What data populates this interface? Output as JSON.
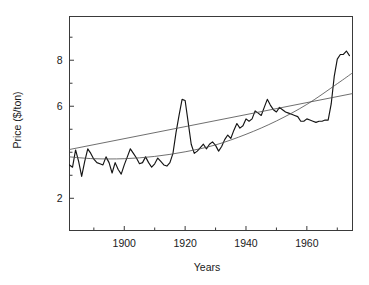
{
  "chart_data": {
    "type": "line",
    "title": "",
    "xlabel": "Years",
    "ylabel": "Price ($/ton)",
    "xlim": [
      1882,
      1975
    ],
    "ylim": [
      0.6,
      9.9
    ],
    "grid": false,
    "legend": "none",
    "x_ticks_major": [
      1900,
      1920,
      1940,
      1960
    ],
    "x_tick_labels": [
      "1900",
      "1920",
      "1940",
      "1960"
    ],
    "x_ticks_minor": [
      1890,
      1910,
      1930,
      1950,
      1970
    ],
    "y_ticks_major": [
      2,
      6,
      8
    ],
    "y_tick_labels": [
      "2",
      "6",
      "8"
    ],
    "y_ticks_minor": [
      3,
      4,
      5,
      7,
      9
    ],
    "series": [
      {
        "name": "price",
        "style": "observed-series",
        "x": [
          1882,
          1883,
          1884,
          1885,
          1886,
          1887,
          1888,
          1889,
          1890,
          1891,
          1892,
          1893,
          1894,
          1895,
          1896,
          1897,
          1898,
          1899,
          1900,
          1901,
          1902,
          1903,
          1904,
          1905,
          1906,
          1907,
          1908,
          1909,
          1910,
          1911,
          1912,
          1913,
          1914,
          1915,
          1916,
          1917,
          1918,
          1919,
          1920,
          1921,
          1922,
          1923,
          1924,
          1925,
          1926,
          1927,
          1928,
          1929,
          1930,
          1931,
          1932,
          1933,
          1934,
          1935,
          1936,
          1937,
          1938,
          1939,
          1940,
          1941,
          1942,
          1943,
          1944,
          1945,
          1946,
          1947,
          1948,
          1949,
          1950,
          1951,
          1952,
          1953,
          1954,
          1955,
          1956,
          1957,
          1958,
          1959,
          1960,
          1961,
          1962,
          1963,
          1964,
          1965,
          1966,
          1967,
          1968,
          1969,
          1970,
          1971,
          1972,
          1973,
          1974
        ],
        "y": [
          3.45,
          3.35,
          4.1,
          3.6,
          2.95,
          3.6,
          4.15,
          3.95,
          3.7,
          3.55,
          3.5,
          3.45,
          3.8,
          3.55,
          3.1,
          3.55,
          3.25,
          3.05,
          3.45,
          3.8,
          4.15,
          3.95,
          3.75,
          3.5,
          3.55,
          3.8,
          3.55,
          3.35,
          3.5,
          3.75,
          3.6,
          3.45,
          3.4,
          3.55,
          3.95,
          4.85,
          5.6,
          6.3,
          6.25,
          5.3,
          4.35,
          3.95,
          4.05,
          4.2,
          4.35,
          4.15,
          4.35,
          4.45,
          4.3,
          4.05,
          4.25,
          4.55,
          4.75,
          4.6,
          4.95,
          5.25,
          5.05,
          5.15,
          5.45,
          5.35,
          5.45,
          5.8,
          5.7,
          5.6,
          5.95,
          6.3,
          6.05,
          5.85,
          5.75,
          5.95,
          5.85,
          5.75,
          5.7,
          5.65,
          5.6,
          5.55,
          5.35,
          5.35,
          5.45,
          5.4,
          5.35,
          5.3,
          5.35,
          5.35,
          5.4,
          5.4,
          6.1,
          7.3,
          8.05,
          8.25,
          8.25,
          8.4,
          8.2
        ]
      },
      {
        "name": "quadratic-trend",
        "style": "fitted-curve",
        "x": [
          1882,
          1890,
          1900,
          1910,
          1920,
          1930,
          1940,
          1950,
          1960,
          1970,
          1975
        ],
        "y": [
          3.8,
          3.72,
          3.72,
          3.82,
          4.02,
          4.32,
          4.78,
          5.36,
          6.08,
          6.98,
          7.45
        ]
      },
      {
        "name": "linear-trend",
        "style": "fitted-line",
        "x": [
          1882,
          1975
        ],
        "y": [
          4.12,
          6.55
        ]
      }
    ]
  },
  "axes": {
    "y_axis_label": "Price ($/ton)",
    "x_axis_label": "Years"
  }
}
